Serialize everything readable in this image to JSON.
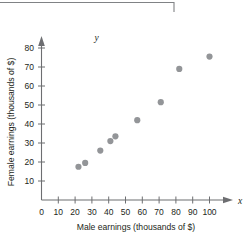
{
  "figure": {
    "frame_label": "top-border-rule",
    "marker_color": "#939598",
    "axis_color": "#6d6e71",
    "text_color": "#231f20"
  },
  "axes": {
    "x_variable_symbol": "x",
    "y_variable_symbol": "y",
    "x_title": "Male earnings (thousands of $)",
    "y_title": "Female earnings (thousands of $)",
    "x_ticks": [
      "0",
      "10",
      "20",
      "30",
      "40",
      "50",
      "60",
      "70",
      "80",
      "90",
      "100"
    ],
    "y_ticks": [
      "10",
      "20",
      "30",
      "40",
      "50",
      "60",
      "70",
      "80"
    ]
  },
  "chart_data": {
    "type": "scatter",
    "title": "",
    "xlabel": "Male earnings (thousands of $)",
    "ylabel": "Female earnings (thousands of $)",
    "xlim": [
      0,
      105
    ],
    "ylim": [
      0,
      85
    ],
    "xticks": [
      0,
      10,
      20,
      30,
      40,
      50,
      60,
      70,
      80,
      90,
      100
    ],
    "yticks": [
      10,
      20,
      30,
      40,
      50,
      60,
      70,
      80
    ],
    "grid": false,
    "legend": false,
    "series": [
      {
        "name": "Earnings by occupation",
        "marker": "circle",
        "color": "#939598",
        "points": [
          {
            "x": 22,
            "y": 17.5
          },
          {
            "x": 26,
            "y": 19.5
          },
          {
            "x": 35,
            "y": 26
          },
          {
            "x": 41,
            "y": 31
          },
          {
            "x": 44,
            "y": 33.5
          },
          {
            "x": 57,
            "y": 42
          },
          {
            "x": 71,
            "y": 51.5
          },
          {
            "x": 82,
            "y": 69
          },
          {
            "x": 100,
            "y": 75.5
          }
        ]
      }
    ]
  }
}
